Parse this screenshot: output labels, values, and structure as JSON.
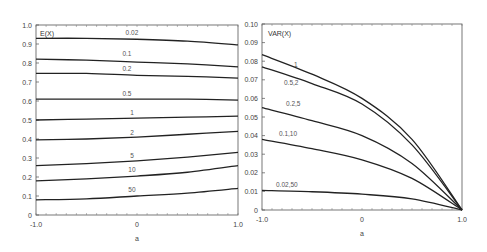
{
  "chart_data": [
    {
      "type": "line",
      "title": "E(X)",
      "xlabel": "a",
      "ylabel": "",
      "xlim": [
        -1.0,
        1.0
      ],
      "ylim": [
        0,
        1.0
      ],
      "x_ticks": [
        "-1.0",
        "0",
        "1.0"
      ],
      "y_ticks": [
        "0",
        "0.1",
        "0.2",
        "0.3",
        "0.4",
        "0.5",
        "0.6",
        "0.7",
        "0.8",
        "0.9",
        "1.0"
      ],
      "grid": false,
      "x": [
        -1.0,
        -0.5,
        0,
        0.5,
        1.0
      ],
      "series": [
        {
          "name": "0.02",
          "values": [
            0.93,
            0.93,
            0.925,
            0.915,
            0.895
          ]
        },
        {
          "name": "0.1",
          "values": [
            0.82,
            0.815,
            0.805,
            0.795,
            0.78
          ]
        },
        {
          "name": "0.2",
          "values": [
            0.745,
            0.745,
            0.735,
            0.73,
            0.72
          ]
        },
        {
          "name": "0.5",
          "values": [
            0.61,
            0.61,
            0.61,
            0.61,
            0.605
          ]
        },
        {
          "name": "1",
          "values": [
            0.5,
            0.505,
            0.51,
            0.515,
            0.52
          ]
        },
        {
          "name": "2",
          "values": [
            0.395,
            0.4,
            0.41,
            0.425,
            0.44
          ]
        },
        {
          "name": "5",
          "values": [
            0.26,
            0.27,
            0.285,
            0.305,
            0.33
          ]
        },
        {
          "name": "10",
          "values": [
            0.18,
            0.19,
            0.205,
            0.225,
            0.26
          ]
        },
        {
          "name": "50",
          "values": [
            0.08,
            0.085,
            0.1,
            0.115,
            0.14
          ]
        }
      ],
      "label_positions": [
        {
          "name": "0.02",
          "x": -0.05,
          "y": 0.945
        },
        {
          "name": "0.1",
          "x": -0.1,
          "y": 0.835
        },
        {
          "name": "0.2",
          "x": -0.1,
          "y": 0.76
        },
        {
          "name": "0.5",
          "x": -0.1,
          "y": 0.625
        },
        {
          "name": "1",
          "x": -0.05,
          "y": 0.525
        },
        {
          "name": "2",
          "x": -0.05,
          "y": 0.42
        },
        {
          "name": "5",
          "x": -0.05,
          "y": 0.3
        },
        {
          "name": "10",
          "x": -0.05,
          "y": 0.225
        },
        {
          "name": "50",
          "x": -0.05,
          "y": 0.12
        }
      ]
    },
    {
      "type": "line",
      "title": "VAR(X)",
      "xlabel": "a",
      "ylabel": "",
      "xlim": [
        -1.0,
        1.0
      ],
      "ylim": [
        0,
        0.1
      ],
      "x_ticks": [
        "-1.0",
        "0",
        "1.0"
      ],
      "y_ticks": [
        "0",
        "0.01",
        "0.02",
        "0.03",
        "0.04",
        "0.05",
        "0.06",
        "0.07",
        "0.08",
        "0.09",
        "0.10"
      ],
      "grid": false,
      "x": [
        -1.0,
        -0.5,
        0,
        0.5,
        1.0
      ],
      "series": [
        {
          "name": "1",
          "values": [
            0.0835,
            0.073,
            0.06,
            0.038,
            0.0
          ]
        },
        {
          "name": "0.5,2",
          "values": [
            0.077,
            0.068,
            0.057,
            0.035,
            0.0
          ]
        },
        {
          "name": "0.2,5",
          "values": [
            0.055,
            0.048,
            0.04,
            0.025,
            0.0
          ]
        },
        {
          "name": "0.1,10",
          "values": [
            0.038,
            0.033,
            0.027,
            0.017,
            0.0
          ]
        },
        {
          "name": "0.02,50",
          "values": [
            0.0105,
            0.0098,
            0.0085,
            0.006,
            0.0
          ]
        }
      ],
      "label_positions": [
        {
          "name": "1",
          "x": -0.68,
          "y": 0.077
        },
        {
          "name": "0.5,2",
          "x": -0.78,
          "y": 0.067
        },
        {
          "name": "0.2,5",
          "x": -0.76,
          "y": 0.056
        },
        {
          "name": "0.1,10",
          "x": -0.83,
          "y": 0.04
        },
        {
          "name": "0.02,50",
          "x": -0.86,
          "y": 0.0125
        }
      ]
    }
  ]
}
